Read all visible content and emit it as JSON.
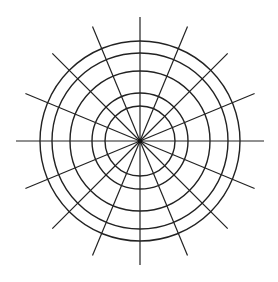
{
  "diagram": {
    "type": "polar-grid",
    "ring_count": 5,
    "ring_radii_relative": [
      0.35,
      0.48,
      0.7,
      0.88,
      1.0
    ],
    "spoke_count": 16,
    "spoke_angle_step_degrees": 22.5,
    "stroke_color": "#222222",
    "background_color": "#ffffff"
  }
}
